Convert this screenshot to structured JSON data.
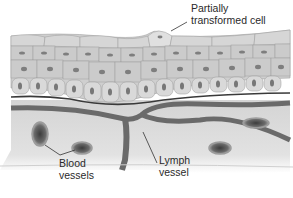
{
  "diagram": {
    "labels": {
      "transformed_cell_line1": "Partially",
      "transformed_cell_line2": "transformed cell",
      "blood_line1": "Blood",
      "blood_line2": "vessels",
      "lymph_line1": "Lymph",
      "lymph_line2": "vessel"
    },
    "structures": [
      {
        "id": "partially-transformed-cell",
        "label": "Partially transformed cell"
      },
      {
        "id": "blood-vessels",
        "label": "Blood vessels"
      },
      {
        "id": "lymph-vessel",
        "label": "Lymph vessel"
      }
    ],
    "colors": {
      "cell_fill": "#c9c9c9",
      "cell_stroke": "#9a9a9a",
      "nucleus": "#7a7a7a",
      "basement_membrane": "#3a3a3a",
      "stroma": "#d8d8d8",
      "vessel": "#6e6e6e",
      "leader_line": "#333333"
    }
  }
}
